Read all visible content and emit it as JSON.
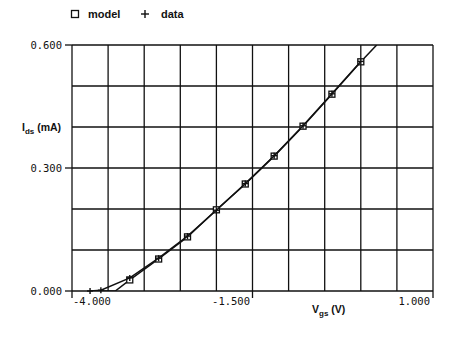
{
  "chart_data": {
    "type": "line",
    "title": "",
    "xlabel": "V_gs (V)",
    "ylabel": "I_ds (mA)",
    "xlim": [
      -4.0,
      1.0
    ],
    "ylim": [
      0.0,
      0.6
    ],
    "grid": true,
    "x_gridlines": [
      -4.0,
      -3.5,
      -3.0,
      -2.5,
      -2.0,
      -1.5,
      -1.0,
      -0.5,
      0.0,
      0.5,
      1.0
    ],
    "y_gridlines": [
      0.0,
      0.1,
      0.2,
      0.3,
      0.4,
      0.5,
      0.6
    ],
    "x_tick_labels": [
      "-4.000",
      "-1.500",
      "1.000"
    ],
    "y_tick_labels": [
      "0.000",
      "0.300",
      "0.600"
    ],
    "legend": {
      "position": "top-left",
      "entries": [
        {
          "name": "model",
          "marker": "square"
        },
        {
          "name": "data",
          "marker": "plus"
        }
      ]
    },
    "series": [
      {
        "name": "model",
        "marker": "square",
        "x": [
          -3.75,
          -3.6,
          -3.4,
          -3.2,
          -2.8,
          -2.4,
          -2.0,
          -1.6,
          -1.2,
          -0.8,
          -0.4,
          0.0,
          0.22
        ],
        "y": [
          0.0,
          0.0,
          0.0,
          0.027,
          0.078,
          0.132,
          0.198,
          0.261,
          0.329,
          0.402,
          0.48,
          0.559,
          0.6
        ],
        "marker_x": [
          -3.2,
          -2.8,
          -2.4,
          -2.0,
          -1.6,
          -1.2,
          -0.8,
          -0.4,
          0.0
        ],
        "marker_y": [
          0.027,
          0.078,
          0.132,
          0.198,
          0.261,
          0.329,
          0.402,
          0.48,
          0.559
        ]
      },
      {
        "name": "data",
        "marker": "plus",
        "x": [
          -3.75,
          -3.6,
          -3.2,
          -2.8,
          -2.4,
          -2.0,
          -1.6,
          -1.2,
          -0.8,
          -0.4,
          0.0
        ],
        "y": [
          0.0,
          0.002,
          0.032,
          0.08,
          0.134,
          0.197,
          0.262,
          0.33,
          0.403,
          0.481,
          0.56
        ]
      }
    ]
  },
  "legend": {
    "model_label": "model",
    "data_label": "data",
    "model_symbol": "□",
    "data_symbol": "+"
  },
  "axes": {
    "y_ticks": [
      "0.600",
      "0.300",
      "0.000"
    ],
    "x_ticks": [
      "-4.000",
      "-1.500",
      "1.000"
    ],
    "y_label_main": "I",
    "y_label_sub": "ds",
    "y_label_unit": " (mA)",
    "x_label_main": "V",
    "x_label_sub": "gs",
    "x_label_unit": " (V)"
  }
}
